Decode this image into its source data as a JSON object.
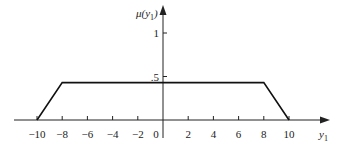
{
  "chart_data": {
    "type": "line",
    "title": "",
    "xlabel": "y1",
    "ylabel": "μ(y1)",
    "x": [
      -10,
      -8,
      8,
      10
    ],
    "series": [
      {
        "name": "membership",
        "x": [
          -10,
          -8,
          8,
          10
        ],
        "values": [
          0,
          0.43,
          0.43,
          0
        ]
      }
    ],
    "x_ticks": [
      -10,
      -8,
      -6,
      -4,
      -2,
      0,
      2,
      4,
      6,
      8,
      10
    ],
    "x_tick_labels": [
      "−10",
      "−8",
      "−6",
      "−4",
      "−2",
      "0",
      "2",
      "4",
      "6",
      "8",
      "10"
    ],
    "y_ticks": [
      0.5,
      1
    ],
    "y_tick_labels": [
      ".5",
      "1"
    ],
    "xlim": [
      -12,
      12
    ],
    "ylim": [
      0,
      1.1
    ],
    "grid": false,
    "legend": "none"
  },
  "labels": {
    "y_axis": "μ(y",
    "y_axis_sub": "1",
    "y_axis_close": ")",
    "x_axis": "y",
    "x_axis_sub": "1"
  }
}
